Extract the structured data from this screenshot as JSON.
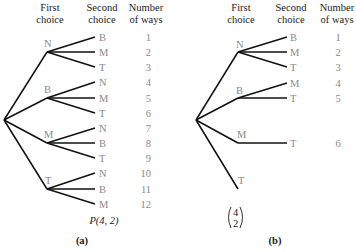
{
  "colors": {
    "edge": "#111111",
    "label": "#8a8a8a",
    "header": "#1a1a1a"
  },
  "panels": [
    {
      "id": "a",
      "caption": "(a)",
      "formula": "P(4, 2)",
      "headers": {
        "first": [
          "First",
          "choice"
        ],
        "second": [
          "Second",
          "choice"
        ],
        "ways": [
          "Number",
          "of ways"
        ]
      },
      "branches": [
        {
          "first": "N",
          "second": [
            "B",
            "M",
            "T"
          ],
          "ways": [
            "1",
            "2",
            "3"
          ]
        },
        {
          "first": "B",
          "second": [
            "N",
            "M",
            "T"
          ],
          "ways": [
            "4",
            "5",
            "6"
          ]
        },
        {
          "first": "M",
          "second": [
            "N",
            "B",
            "T"
          ],
          "ways": [
            "7",
            "8",
            "9"
          ]
        },
        {
          "first": "T",
          "second": [
            "N",
            "B",
            "M"
          ],
          "ways": [
            "10",
            "11",
            "12"
          ]
        }
      ]
    },
    {
      "id": "b",
      "caption": "(b)",
      "formula_top": "4",
      "formula_bottom": "2",
      "headers": {
        "first": [
          "First",
          "choice"
        ],
        "second": [
          "Second",
          "choice"
        ],
        "ways": [
          "Number",
          "of ways"
        ]
      },
      "branches": [
        {
          "first": "N",
          "second": [
            "B",
            "M",
            "T"
          ],
          "ways": [
            "1",
            "2",
            "3"
          ]
        },
        {
          "first": "B",
          "second": [
            "M",
            "T"
          ],
          "ways": [
            "4",
            "5"
          ]
        },
        {
          "first": "M",
          "second": [
            "T"
          ],
          "ways": [
            "6"
          ]
        },
        {
          "first": "T",
          "second": [],
          "ways": []
        }
      ]
    }
  ]
}
